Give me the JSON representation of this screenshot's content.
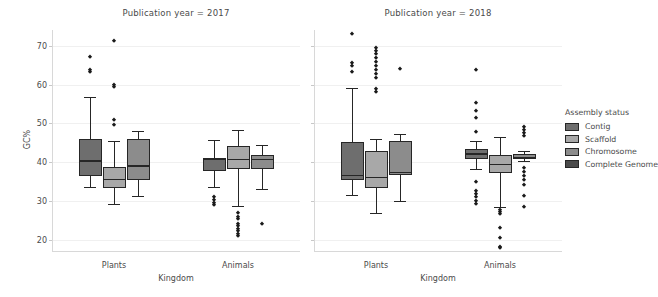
{
  "figure": {
    "y_axis_label": "GC%",
    "x_axis_label": "Kingdom",
    "y_ticks": [
      "20",
      "30",
      "40",
      "50",
      "60",
      "70"
    ],
    "x_ticks": [
      "Plants",
      "Animals"
    ]
  },
  "legend": {
    "title": "Assembly status",
    "items": [
      {
        "label": "Contig",
        "color": "#6e6e6e"
      },
      {
        "label": "Scaffold",
        "color": "#a8a8a8"
      },
      {
        "label": "Chromosome",
        "color": "#8c8c8c"
      },
      {
        "label": "Complete Genome",
        "color": "#4a4a4a"
      }
    ]
  },
  "panels": [
    {
      "title": "Publication year = 2017"
    },
    {
      "title": "Publication year = 2018"
    }
  ],
  "chart_data": {
    "type": "box",
    "title": "",
    "xlabel": "Kingdom",
    "ylabel": "GC%",
    "ylim": [
      17,
      74
    ],
    "yticks": [
      20,
      30,
      40,
      50,
      60,
      70
    ],
    "grid": true,
    "legend_title": "Assembly status",
    "legend_position": "right",
    "facets": [
      {
        "facet_label": "Publication year = 2017",
        "groups": [
          {
            "category": "Plants",
            "boxes": [
              {
                "status": "Contig",
                "color": "#6e6e6e",
                "whisker_low": 33.8,
                "q1": 36.6,
                "median": 40.5,
                "q3": 46.1,
                "whisker_high": 56.7,
                "fliers": [
                  67.1,
                  63.8,
                  63.2
                ]
              },
              {
                "status": "Scaffold",
                "color": "#a8a8a8",
                "whisker_low": 29.2,
                "q1": 33.4,
                "median": 35.8,
                "q3": 38.8,
                "whisker_high": 45.5,
                "fliers": [
                  71.2,
                  60.0,
                  59.3,
                  50.8,
                  49.7
                ]
              },
              {
                "status": "Chromosome",
                "color": "#8c8c8c",
                "whisker_low": 31.5,
                "q1": 35.5,
                "median": 39.3,
                "q3": 46.1,
                "whisker_high": 48.1,
                "fliers": []
              }
            ]
          },
          {
            "category": "Animals",
            "boxes": [
              {
                "status": "Contig",
                "color": "#6e6e6e",
                "whisker_low": 33.8,
                "q1": 37.9,
                "median": 40.9,
                "q3": 41.2,
                "whisker_high": 45.7,
                "fliers": [
                  31.0,
                  30.3,
                  29.6,
                  29.0
                ]
              },
              {
                "status": "Scaffold",
                "color": "#a8a8a8",
                "whisker_low": 28.8,
                "q1": 38.2,
                "median": 41.0,
                "q3": 44.2,
                "whisker_high": 48.3,
                "fliers": [
                  26.9,
                  26.1,
                  25.4,
                  24.3,
                  23.6,
                  23.0,
                  22.4,
                  21.6,
                  21.2
                ]
              },
              {
                "status": "Chromosome",
                "color": "#8c8c8c",
                "whisker_low": 33.2,
                "q1": 38.4,
                "median": 40.9,
                "q3": 41.8,
                "whisker_high": 44.6,
                "fliers": [
                  24.1
                ]
              }
            ]
          }
        ]
      },
      {
        "facet_label": "Publication year = 2018",
        "groups": [
          {
            "category": "Plants",
            "boxes": [
              {
                "status": "Contig",
                "color": "#6e6e6e",
                "whisker_low": 31.6,
                "q1": 35.6,
                "median": 36.8,
                "q3": 45.3,
                "whisker_high": 59.1,
                "fliers": [
                  73.0,
                  65.6,
                  64.7,
                  63.1
                ]
              },
              {
                "status": "Scaffold",
                "color": "#a8a8a8",
                "whisker_low": 27.1,
                "q1": 33.4,
                "median": 36.3,
                "q3": 42.9,
                "whisker_high": 46.0,
                "fliers": [
                  69.5,
                  68.6,
                  67.8,
                  66.8,
                  65.9,
                  64.8,
                  63.7,
                  62.6,
                  61.6,
                  58.9,
                  58.2
                ]
              },
              {
                "status": "Chromosome",
                "color": "#8c8c8c",
                "whisker_low": 30.1,
                "q1": 36.8,
                "median": 37.6,
                "q3": 45.6,
                "whisker_high": 47.4,
                "fliers": [
                  64.1
                ]
              }
            ]
          },
          {
            "category": "Animals",
            "boxes": [
              {
                "status": "Contig",
                "color": "#6e6e6e",
                "whisker_low": 38.2,
                "q1": 41.0,
                "median": 42.3,
                "q3": 43.4,
                "whisker_high": 45.6,
                "fliers": [
                  63.8,
                  55.3,
                  53.2,
                  51.4,
                  47.7,
                  35.0,
                  32.6,
                  31.9,
                  31.0,
                  30.2,
                  29.4
                ]
              },
              {
                "status": "Scaffold",
                "color": "#a8a8a8",
                "whisker_low": 28.5,
                "q1": 37.2,
                "median": 39.7,
                "q3": 42.0,
                "whisker_high": 46.4,
                "fliers": [
                  27.9,
                  27.3,
                  26.8,
                  23.1,
                  20.5,
                  18.4,
                  17.9
                ]
              },
              {
                "status": "Chromosome",
                "color": "#8c8c8c",
                "whisker_low": 40.4,
                "q1": 41.0,
                "median": 41.5,
                "q3": 42.1,
                "whisker_high": 43.0,
                "fliers": [
                  49.2,
                  48.4,
                  47.6,
                  46.8,
                  38.6,
                  37.6,
                  36.5,
                  35.4,
                  34.3,
                  31.4,
                  28.5
                ]
              }
            ]
          }
        ]
      }
    ]
  }
}
